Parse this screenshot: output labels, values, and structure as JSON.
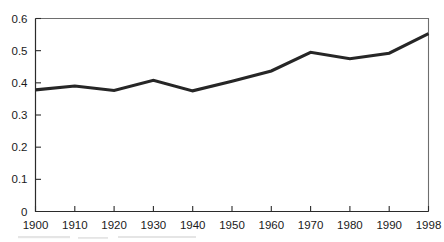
{
  "chart_data": {
    "type": "line",
    "title": "",
    "subtitle": "",
    "xlabel": "",
    "ylabel": "",
    "x": [
      1900,
      1910,
      1920,
      1930,
      1940,
      1950,
      1960,
      1970,
      1980,
      1990,
      1998
    ],
    "xtick_labels": [
      "1900",
      "1910",
      "1920",
      "1930",
      "1940",
      "1950",
      "1960",
      "1970",
      "1980",
      "1990",
      "1998"
    ],
    "ytick_labels": [
      "0",
      "0.1",
      "0.2",
      "0.3",
      "0.4",
      "0.5",
      "0.6"
    ],
    "ytick_values": [
      0,
      0.1,
      0.2,
      0.3,
      0.4,
      0.5,
      0.6
    ],
    "values": [
      0.378,
      0.39,
      0.376,
      0.408,
      0.375,
      0.405,
      0.437,
      0.495,
      0.475,
      0.492,
      0.553
    ],
    "series": [
      {
        "name": "",
        "color": "#262626",
        "values": [
          0.378,
          0.39,
          0.376,
          0.408,
          0.375,
          0.405,
          0.437,
          0.495,
          0.475,
          0.492,
          0.553
        ]
      }
    ],
    "ylim": [
      0,
      0.6
    ],
    "xlim": [
      1900,
      1998
    ],
    "grid": false,
    "legend": false,
    "legend_position": "none",
    "annotations": []
  },
  "style": {
    "line_color": "#262626",
    "axis_color": "#2b2b2b",
    "frame_color": "#6e6e6e",
    "text_color": "#1a1a1a",
    "background": "#ffffff"
  }
}
